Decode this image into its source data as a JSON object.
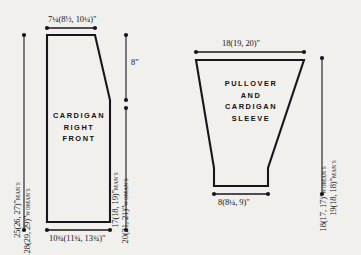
{
  "page": {
    "background_color": "#f2f0ec",
    "line_color": "#17161a"
  },
  "pieces": [
    {
      "id": "cardigan-right-front",
      "name_lines": [
        "CARDIGAN",
        "RIGHT",
        "FRONT"
      ],
      "name_text": "CARDIGAN RIGHT FRONT"
    },
    {
      "id": "pullover-and-cardigan-sleeve",
      "name_lines": [
        "PULLOVER",
        "AND",
        "CARDIGAN",
        "SLEEVE"
      ],
      "name_text": "PULLOVER AND CARDIGAN SLEEVE"
    }
  ],
  "cardigan": {
    "top_width": {
      "whole": "7",
      "frac": "¼",
      "paren_open": "(8",
      "paren_frac1": "½",
      "paren_mid": ", 10",
      "paren_frac2": "¼",
      "paren_close": ")\"",
      "text": "7¼(8½, 10¼)\""
    },
    "bottom_width": {
      "whole": "10",
      "frac": "¾",
      "paren_open": "(11",
      "paren_frac1": "¾",
      "paren_mid": ", 13",
      "paren_frac2": "¾",
      "paren_close": ")\"",
      "text": "10¾(11¾, 13¾)\""
    },
    "armhole_depth": {
      "text": "8\""
    },
    "left_height_mans": {
      "value": "25(26, 27)\"",
      "suffix": "MAN'S"
    },
    "left_height_womans": {
      "value": "28(29, 29)\"",
      "suffix": "WOMAN'S"
    },
    "right_height_mans": {
      "value": "17(18, 19)\"",
      "suffix": "MAN'S"
    },
    "right_height_womans": {
      "value": "20(21, 21)\"",
      "suffix": "WOMAN'S"
    }
  },
  "sleeve": {
    "top_width": {
      "text": "18(19, 20)\""
    },
    "cuff_width": {
      "whole": "8",
      "paren_open": "(8",
      "paren_frac1": "¼",
      "paren_close": ", 9)\"",
      "text": "8(8¼, 9)\""
    },
    "length_mans": {
      "value": "19(18, 18)\"",
      "suffix": "MAN'S"
    },
    "length_womans": {
      "value": "18(17, 17)\"",
      "suffix": "WOMAN'S"
    }
  }
}
